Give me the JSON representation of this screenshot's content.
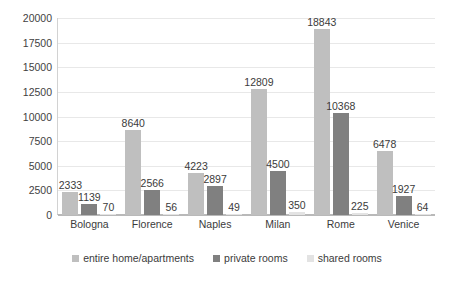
{
  "chart_data": {
    "type": "bar",
    "title": "",
    "subtitle": "",
    "xlabel": "",
    "ylabel": "",
    "ylim": [
      0,
      20000
    ],
    "yticks": [
      0,
      2500,
      5000,
      7500,
      10000,
      12500,
      15000,
      17500,
      20000
    ],
    "ytick_labels": [
      "0",
      "2500",
      "5000",
      "7500",
      "10000",
      "12500",
      "15000",
      "17500",
      "20000"
    ],
    "grid": true,
    "legend_position": "bottom",
    "categories": [
      "Bologna",
      "Florence",
      "Naples",
      "Milan",
      "Rome",
      "Venice"
    ],
    "series": [
      {
        "name": "entire home/apartments",
        "color": "#bfbfbf",
        "values": [
          2333,
          8640,
          4223,
          12809,
          18843,
          6478
        ],
        "labels": [
          "2333",
          "8640",
          "4223",
          "12809",
          "18843",
          "6478"
        ]
      },
      {
        "name": "private rooms",
        "color": "#808080",
        "values": [
          1139,
          2566,
          2897,
          4500,
          10368,
          1927
        ],
        "labels": [
          "1139",
          "2566",
          "2897",
          "4500",
          "10368",
          "1927"
        ]
      },
      {
        "name": "shared rooms",
        "color": "#e3e3e3",
        "values": [
          70,
          56,
          49,
          350,
          225,
          64
        ],
        "labels": [
          "70",
          "56",
          "49",
          "350",
          "225",
          "64"
        ]
      }
    ]
  },
  "legend": {
    "items": [
      {
        "label": "entire home/apartments",
        "color": "#bfbfbf"
      },
      {
        "label": "private rooms",
        "color": "#808080"
      },
      {
        "label": "shared rooms",
        "color": "#e3e3e3"
      }
    ]
  },
  "artifact": {
    "line1": "",
    "line2": ""
  }
}
